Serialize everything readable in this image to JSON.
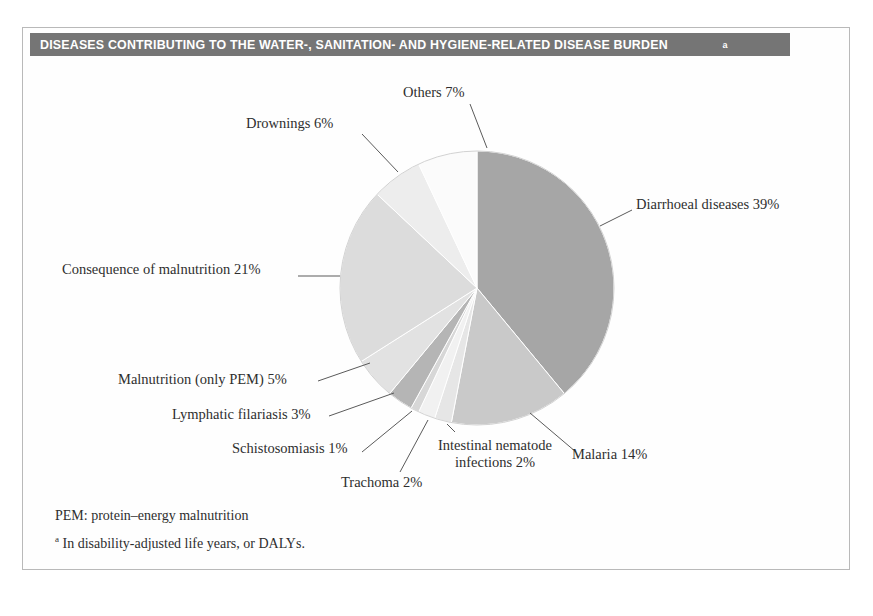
{
  "figure": {
    "title": "DISEASES CONTRIBUTING TO THE WATER-, SANITATION- AND HYGIENE-RELATED DISEASE BURDEN",
    "title_superscript": "a",
    "footnotes": {
      "pem": "PEM: protein–energy malnutrition",
      "daly_marker": "a",
      "daly": " In disability-adjusted life years, or DALYs."
    }
  },
  "labels": {
    "others": "Others 7%",
    "drownings": "Drownings 6%",
    "diarrhoeal": "Diarrhoeal diseases 39%",
    "consequence": "Consequence of malnutrition 21%",
    "pem": "Malnutrition (only PEM) 5%",
    "lymphatic": "Lymphatic filariasis 3%",
    "schistosomiasis": "Schistosomiasis 1%",
    "trachoma": "Trachoma 2%",
    "nematode": "Intestinal nematode infections 2%",
    "malaria": "Malaria 14%"
  },
  "chart_data": {
    "type": "pie",
    "title": "DISEASES CONTRIBUTING TO THE WATER-, SANITATION- AND HYGIENE-RELATED DISEASE BURDEN",
    "unit": "percent of disability-adjusted life years (DALYs)",
    "start_angle_deg": 0,
    "direction": "clockwise",
    "center": [
      477,
      288
    ],
    "radius": 137,
    "categories": [
      "Diarrhoeal diseases",
      "Malaria",
      "Intestinal nematode infections",
      "Trachoma",
      "Schistosomiasis",
      "Lymphatic filariasis",
      "Malnutrition (only PEM)",
      "Consequence of malnutrition",
      "Drownings",
      "Others"
    ],
    "values": [
      39,
      14,
      2,
      2,
      1,
      3,
      5,
      21,
      6,
      7
    ],
    "labels": [
      "Diarrhoeal diseases 39%",
      "Malaria 14%",
      "Intestinal nematode infections 2%",
      "Trachoma 2%",
      "Schistosomiasis 1%",
      "Lymphatic filariasis 3%",
      "Malnutrition (only PEM) 5%",
      "Consequence of malnutrition 21%",
      "Drownings 6%",
      "Others 7%"
    ],
    "colors": [
      "#a6a6a6",
      "#c9c9c9",
      "#e6e6e6",
      "#f1f1f1",
      "#d7d7d7",
      "#b5b5b5",
      "#e2e2e2",
      "#dcdcdc",
      "#ededed",
      "#fbfbfb"
    ],
    "legend": "none",
    "grid": false
  },
  "colors": {
    "title_bar": "#757575",
    "title_text": "#ffffff",
    "frame_border": "#b9b9b9",
    "leader_line": "#5a5a5a",
    "slice_edge": "#ffffff",
    "background": "#ffffff"
  }
}
